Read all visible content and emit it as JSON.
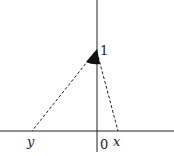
{
  "diagram": {
    "type": "coordinate-geometry",
    "labels": {
      "one": "1",
      "origin": "0",
      "x": "x",
      "y": "y"
    },
    "colors": {
      "line": "#222222",
      "background": "#ffffff"
    }
  }
}
